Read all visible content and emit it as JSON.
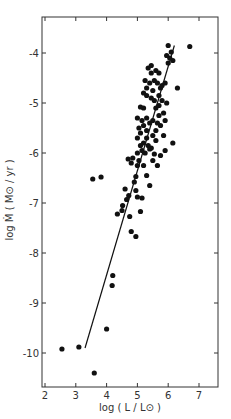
{
  "chart_data": {
    "type": "scatter",
    "title": "",
    "xlabel": "log ( L / L⊙ )",
    "ylabel": "log Ṁ ( M⊙ / yr )",
    "xlim": [
      2,
      7.6
    ],
    "ylim": [
      -10.7,
      -3.25
    ],
    "xticks": [
      2,
      3,
      4,
      5,
      6,
      7
    ],
    "yticks": [
      -4,
      -5,
      -6,
      -7,
      -8,
      -9,
      -10
    ],
    "grid": false,
    "fit_line": {
      "x": [
        3.3,
        6.2
      ],
      "y": [
        -9.9,
        -3.85
      ]
    },
    "points": [
      {
        "x": 2.55,
        "y": -9.92
      },
      {
        "x": 3.1,
        "y": -9.88
      },
      {
        "x": 3.6,
        "y": -10.4
      },
      {
        "x": 4.0,
        "y": -9.52
      },
      {
        "x": 4.2,
        "y": -8.45
      },
      {
        "x": 4.18,
        "y": -8.65
      },
      {
        "x": 3.55,
        "y": -6.52
      },
      {
        "x": 3.82,
        "y": -6.48
      },
      {
        "x": 4.35,
        "y": -7.22
      },
      {
        "x": 4.5,
        "y": -7.15
      },
      {
        "x": 4.52,
        "y": -7.05
      },
      {
        "x": 4.6,
        "y": -6.72
      },
      {
        "x": 4.65,
        "y": -6.93
      },
      {
        "x": 4.72,
        "y": -6.85
      },
      {
        "x": 4.75,
        "y": -7.27
      },
      {
        "x": 4.8,
        "y": -7.57
      },
      {
        "x": 4.95,
        "y": -7.67
      },
      {
        "x": 5.1,
        "y": -7.17
      },
      {
        "x": 4.9,
        "y": -6.58
      },
      {
        "x": 4.95,
        "y": -6.47
      },
      {
        "x": 4.95,
        "y": -6.75
      },
      {
        "x": 5.0,
        "y": -6.88
      },
      {
        "x": 5.15,
        "y": -6.9
      },
      {
        "x": 5.3,
        "y": -6.45
      },
      {
        "x": 5.4,
        "y": -6.65
      },
      {
        "x": 5.0,
        "y": -6.25
      },
      {
        "x": 5.05,
        "y": -6.15
      },
      {
        "x": 4.85,
        "y": -6.1
      },
      {
        "x": 4.7,
        "y": -6.12
      },
      {
        "x": 4.8,
        "y": -6.2
      },
      {
        "x": 5.2,
        "y": -6.25
      },
      {
        "x": 5.0,
        "y": -6.0
      },
      {
        "x": 5.15,
        "y": -5.95
      },
      {
        "x": 5.25,
        "y": -6.0
      },
      {
        "x": 5.4,
        "y": -5.92
      },
      {
        "x": 5.55,
        "y": -6.02
      },
      {
        "x": 5.6,
        "y": -5.75
      },
      {
        "x": 5.5,
        "y": -5.65
      },
      {
        "x": 5.3,
        "y": -5.7
      },
      {
        "x": 5.2,
        "y": -5.8
      },
      {
        "x": 5.1,
        "y": -5.85
      },
      {
        "x": 5.0,
        "y": -5.7
      },
      {
        "x": 5.35,
        "y": -5.85
      },
      {
        "x": 5.45,
        "y": -5.9
      },
      {
        "x": 5.3,
        "y": -5.55
      },
      {
        "x": 5.1,
        "y": -5.6
      },
      {
        "x": 5.2,
        "y": -5.45
      },
      {
        "x": 5.4,
        "y": -5.4
      },
      {
        "x": 5.5,
        "y": -5.35
      },
      {
        "x": 5.3,
        "y": -5.3
      },
      {
        "x": 5.15,
        "y": -5.35
      },
      {
        "x": 5.0,
        "y": -5.3
      },
      {
        "x": 5.05,
        "y": -5.5
      },
      {
        "x": 5.2,
        "y": -5.1
      },
      {
        "x": 5.1,
        "y": -5.08
      },
      {
        "x": 5.6,
        "y": -5.1
      },
      {
        "x": 5.7,
        "y": -5.05
      },
      {
        "x": 5.55,
        "y": -4.95
      },
      {
        "x": 5.45,
        "y": -4.9
      },
      {
        "x": 5.3,
        "y": -4.85
      },
      {
        "x": 5.2,
        "y": -4.8
      },
      {
        "x": 5.5,
        "y": -4.75
      },
      {
        "x": 5.7,
        "y": -4.85
      },
      {
        "x": 5.75,
        "y": -4.7
      },
      {
        "x": 5.4,
        "y": -4.6
      },
      {
        "x": 5.25,
        "y": -4.55
      },
      {
        "x": 5.3,
        "y": -4.7
      },
      {
        "x": 5.55,
        "y": -4.55
      },
      {
        "x": 5.65,
        "y": -4.6
      },
      {
        "x": 5.8,
        "y": -4.65
      },
      {
        "x": 5.9,
        "y": -4.6
      },
      {
        "x": 5.45,
        "y": -4.4
      },
      {
        "x": 5.35,
        "y": -4.3
      },
      {
        "x": 5.45,
        "y": -4.25
      },
      {
        "x": 5.6,
        "y": -4.35
      },
      {
        "x": 5.7,
        "y": -4.4
      },
      {
        "x": 5.95,
        "y": -4.05
      },
      {
        "x": 6.05,
        "y": -4.1
      },
      {
        "x": 6.0,
        "y": -3.85
      },
      {
        "x": 6.1,
        "y": -3.98
      },
      {
        "x": 6.15,
        "y": -4.15
      },
      {
        "x": 6.0,
        "y": -4.2
      },
      {
        "x": 6.3,
        "y": -4.7
      },
      {
        "x": 6.7,
        "y": -3.87
      },
      {
        "x": 6.15,
        "y": -5.8
      },
      {
        "x": 5.85,
        "y": -5.65
      },
      {
        "x": 5.9,
        "y": -5.95
      },
      {
        "x": 5.75,
        "y": -6.05
      },
      {
        "x": 5.5,
        "y": -6.15
      },
      {
        "x": 5.65,
        "y": -6.25
      },
      {
        "x": 5.6,
        "y": -5.55
      },
      {
        "x": 5.75,
        "y": -5.45
      },
      {
        "x": 5.7,
        "y": -5.25
      },
      {
        "x": 5.85,
        "y": -5.2
      },
      {
        "x": 5.9,
        "y": -5.35
      },
      {
        "x": 5.65,
        "y": -5.4
      },
      {
        "x": 5.8,
        "y": -4.95
      },
      {
        "x": 5.95,
        "y": -5.0
      }
    ]
  }
}
